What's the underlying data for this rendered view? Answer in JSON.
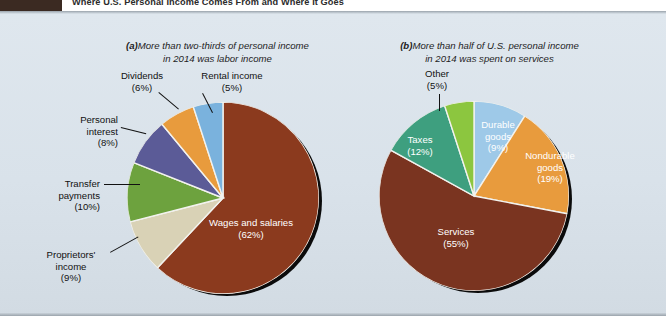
{
  "header": {
    "title": "Where U.S. Personal Income Comes From and Where It Goes",
    "tab_label": ""
  },
  "panels": [
    {
      "id": "a",
      "tag": "(a)",
      "caption": "More than two-thirds of personal income\nin 2014 was labor income"
    },
    {
      "id": "b",
      "tag": "(b)",
      "caption": "More than half of U.S. personal income\nin 2014 was spent on services"
    }
  ],
  "chart_data": [
    {
      "type": "pie",
      "id": "personal-income-sources",
      "title": "More than two-thirds of personal income in 2014 was labor income",
      "labels": [
        "Wages and salaries",
        "Proprietors' income",
        "Transfer payments",
        "Personal interest",
        "Dividends",
        "Rental income"
      ],
      "values": [
        62,
        9,
        10,
        8,
        6,
        5
      ],
      "value_suffix": "%",
      "colors": [
        "#8b3a1e",
        "#d9d2b6",
        "#6da23e",
        "#5b5b97",
        "#e89b3d",
        "#7ab2dd"
      ],
      "legend": "labels-on-chart",
      "start_angle_deg": 0,
      "direction": "clockwise",
      "slice_labels": [
        {
          "name": "Wages and salaries",
          "text": "Wages and salaries\n(62%)",
          "placement": "inside"
        },
        {
          "name": "Proprietors' income",
          "text": "Proprietors'\nincome\n(9%)",
          "placement": "callout"
        },
        {
          "name": "Transfer payments",
          "text": "Transfer\npayments\n(10%)",
          "placement": "callout"
        },
        {
          "name": "Personal interest",
          "text": "Personal\ninterest\n(8%)",
          "placement": "callout"
        },
        {
          "name": "Dividends",
          "text": "Dividends\n(6%)",
          "placement": "callout"
        },
        {
          "name": "Rental income",
          "text": "Rental income\n(5%)",
          "placement": "callout"
        }
      ]
    },
    {
      "type": "pie",
      "id": "personal-income-uses",
      "title": "More than half of U.S. personal income in 2014 was spent on services",
      "labels": [
        "Durable goods",
        "Nondurable goods",
        "Services",
        "Taxes",
        "Other"
      ],
      "values": [
        9,
        19,
        55,
        12,
        5
      ],
      "value_suffix": "%",
      "colors": [
        "#9ec9e8",
        "#e89b3d",
        "#7a3420",
        "#3e9f7f",
        "#8cc63f"
      ],
      "legend": "labels-on-chart",
      "start_angle_deg": 0,
      "direction": "clockwise",
      "slice_labels": [
        {
          "name": "Durable goods",
          "text": "Durable\ngoods\n(9%)",
          "placement": "inside"
        },
        {
          "name": "Nondurable goods",
          "text": "Nondurable\ngoods\n(19%)",
          "placement": "inside"
        },
        {
          "name": "Services",
          "text": "Services\n(55%)",
          "placement": "inside"
        },
        {
          "name": "Taxes",
          "text": "Taxes\n(12%)",
          "placement": "inside"
        },
        {
          "name": "Other",
          "text": "Other\n(5%)",
          "placement": "callout"
        }
      ]
    }
  ],
  "colors": {
    "page_bg": "#dde5ec",
    "header_tab": "#3b2a22",
    "header_text": "#2b2b2b",
    "text": "#111111"
  }
}
